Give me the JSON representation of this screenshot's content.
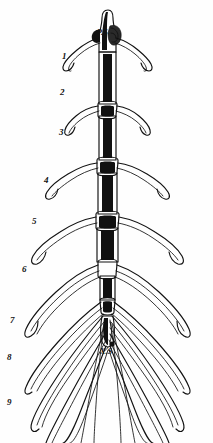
{
  "figure": {
    "kind": "anatomical-engraving",
    "background_color": "#fefefe",
    "ink_color": "#111111"
  },
  "part_labels": [
    {
      "id": "presternum",
      "text": "P.S",
      "x": 97,
      "y": 29
    },
    {
      "id": "xiphisternum",
      "text": "X.S",
      "x": 100,
      "y": 348
    }
  ],
  "rib_labels": [
    {
      "text": "1",
      "x": 62,
      "y": 52
    },
    {
      "text": "2",
      "x": 60,
      "y": 88
    },
    {
      "text": "3",
      "x": 59,
      "y": 128
    },
    {
      "text": "4",
      "x": 44,
      "y": 176
    },
    {
      "text": "5",
      "x": 32,
      "y": 217
    },
    {
      "text": "6",
      "x": 22,
      "y": 265
    },
    {
      "text": "7",
      "x": 10,
      "y": 316
    },
    {
      "text": "8",
      "x": 7,
      "y": 353
    },
    {
      "text": "9",
      "x": 7,
      "y": 398
    }
  ]
}
